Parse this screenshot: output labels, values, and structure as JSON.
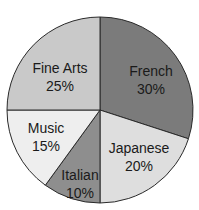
{
  "chart_data": {
    "type": "pie",
    "title": "",
    "categories": [
      "French",
      "Japanese",
      "Italian",
      "Music",
      "Fine Arts"
    ],
    "values": [
      30,
      20,
      10,
      15,
      25
    ],
    "unit": "%",
    "start_angle_deg": 0,
    "direction": "clockwise",
    "colors": [
      "#7b7b7b",
      "#dedede",
      "#8e8e8e",
      "#eeeeee",
      "#c9c9c9"
    ],
    "labels": [
      {
        "name": "French",
        "pct": "30%"
      },
      {
        "name": "Japanese",
        "pct": "20%"
      },
      {
        "name": "Italian",
        "pct": "10%"
      },
      {
        "name": "Music",
        "pct": "15%"
      },
      {
        "name": "Fine Arts",
        "pct": "25%"
      }
    ],
    "legend": "none (labels inside slices)"
  }
}
